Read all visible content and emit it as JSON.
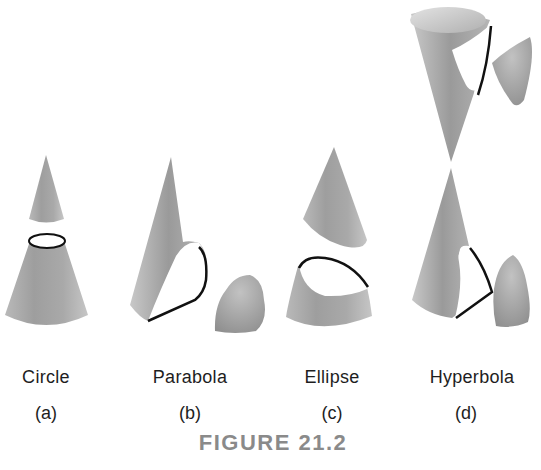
{
  "figure": {
    "caption": "FIGURE 21.2",
    "panels": [
      {
        "id": "a",
        "name": "Circle",
        "sub": "(a)"
      },
      {
        "id": "b",
        "name": "Parabola",
        "sub": "(b)"
      },
      {
        "id": "c",
        "name": "Ellipse",
        "sub": "(c)"
      },
      {
        "id": "d",
        "name": "Hyperbola",
        "sub": "(d)"
      }
    ],
    "colors": {
      "cone_light": "#d4d4d4",
      "cone_mid": "#a8a8a8",
      "cone_dark": "#8c8c8c",
      "curve": "#111111",
      "caption": "#8a8a8a"
    }
  }
}
